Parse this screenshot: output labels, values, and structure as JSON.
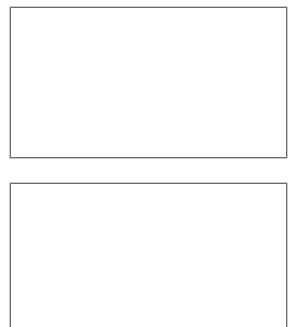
{
  "panels": [
    {
      "label": "",
      "content": ""
    },
    {
      "label": "",
      "content": ""
    }
  ],
  "colors": {
    "border": "#6b6b6b",
    "background": "#ffffff"
  }
}
